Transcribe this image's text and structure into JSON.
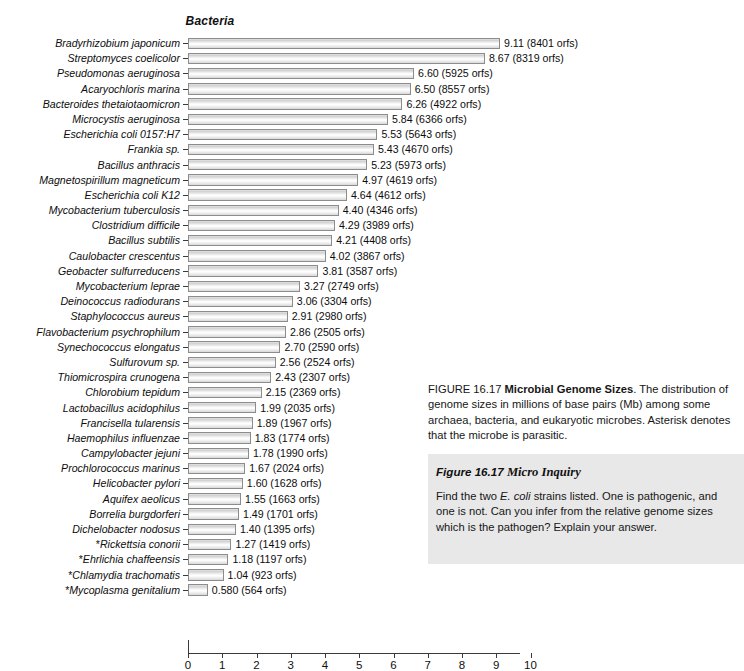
{
  "chart_data": {
    "type": "bar",
    "orientation": "horizontal",
    "title": "Bacteria",
    "xlabel": "",
    "ylabel": "",
    "xlim": [
      0,
      10
    ],
    "xticks": [
      0,
      1,
      2,
      3,
      4,
      5,
      6,
      7,
      8,
      9,
      10
    ],
    "grid": false,
    "legend": "none",
    "units": "millions of base pairs (Mb)",
    "categories": [
      "Bradyrhizobium japonicum",
      "Streptomyces coelicolor",
      "Pseudomonas aeruginosa",
      "Acaryochloris marina",
      "Bacteroides thetaiotaomicron",
      "Microcystis aeruginosa",
      "Escherichia coli 0157:H7",
      "Frankia sp.",
      "Bacillus anthracis",
      "Magnetospirillum magneticum",
      "Escherichia coli K12",
      "Mycobacterium tuberculosis",
      "Clostridium difficile",
      "Bacillus subtilis",
      "Caulobacter crescentus",
      "Geobacter sulfurreducens",
      "Mycobacterium leprae",
      "Deinococcus radiodurans",
      "Staphylococcus aureus",
      "Flavobacterium psychrophilum",
      "Synechococcus elongatus",
      "Sulfurovum sp.",
      "Thiomicrospira crunogena",
      "Chlorobium tepidum",
      "Lactobacillus acidophilus",
      "Francisella tularensis",
      "Haemophilus influenzae",
      "Campylobacter jejuni",
      "Prochlorococcus marinus",
      "Helicobacter pylori",
      "Aquifex aeolicus",
      "Borrelia burgdorferi",
      "Dichelobacter nodosus",
      "*Rickettsia conorii",
      "*Ehrlichia chaffeensis",
      "*Chlamydia trachomatis",
      "*Mycoplasma genitalium"
    ],
    "values": [
      9.11,
      8.67,
      6.6,
      6.5,
      6.26,
      5.84,
      5.53,
      5.43,
      5.23,
      4.97,
      4.64,
      4.4,
      4.29,
      4.21,
      4.02,
      3.81,
      3.27,
      3.06,
      2.91,
      2.86,
      2.7,
      2.56,
      2.43,
      2.15,
      1.99,
      1.89,
      1.83,
      1.78,
      1.67,
      1.6,
      1.55,
      1.49,
      1.4,
      1.27,
      1.18,
      1.04,
      0.58
    ],
    "orfs": [
      8401,
      8319,
      5925,
      8557,
      4922,
      6366,
      5643,
      4670,
      5973,
      4619,
      4612,
      4346,
      3989,
      4408,
      3867,
      3587,
      2749,
      3304,
      2980,
      2505,
      2590,
      2524,
      2307,
      2369,
      2035,
      1967,
      1774,
      1990,
      2024,
      1628,
      1663,
      1701,
      1395,
      1419,
      1197,
      923,
      564
    ],
    "data_labels": [
      "9.11 (8401 orfs)",
      "8.67 (8319 orfs)",
      "6.60 (5925 orfs)",
      "6.50 (8557 orfs)",
      "6.26 (4922 orfs)",
      "5.84 (6366 orfs)",
      "5.53 (5643 orfs)",
      "5.43 (4670 orfs)",
      "5.23 (5973 orfs)",
      "4.97 (4619 orfs)",
      "4.64 (4612 orfs)",
      "4.40 (4346 orfs)",
      "4.29 (3989 orfs)",
      "4.21 (4408 orfs)",
      "4.02 (3867 orfs)",
      "3.81 (3587 orfs)",
      "3.27 (2749 orfs)",
      "3.06 (3304 orfs)",
      "2.91 (2980 orfs)",
      "2.86 (2505 orfs)",
      "2.70 (2590 orfs)",
      "2.56 (2524 orfs)",
      "2.43 (2307 orfs)",
      "2.15 (2369 orfs)",
      "1.99 (2035 orfs)",
      "1.89 (1967 orfs)",
      "1.83 (1774 orfs)",
      "1.78 (1990 orfs)",
      "1.67 (2024 orfs)",
      "1.60 (1628 orfs)",
      "1.55 (1663 orfs)",
      "1.49 (1701 orfs)",
      "1.40 (1395 orfs)",
      "1.27 (1419 orfs)",
      "1.18 (1197 orfs)",
      "1.04 (923 orfs)",
      "0.580 (564 orfs)"
    ]
  },
  "caption": {
    "figure_number": "FIGURE 16.17",
    "figure_title": "Microbial Genome Sizes",
    "body": ". The distribution of genome sizes in millions of base pairs (Mb) among some archaea, bacteria, and eukaryotic microbes. Asterisk denotes that the microbe is parasitic."
  },
  "inquiry": {
    "heading_figure": "Figure 16.17",
    "heading_label": "Micro Inquiry",
    "text_part1": "Find the two ",
    "text_italic": "E. coli",
    "text_part2": " strains listed. One is pathogenic, and one is not. Can you infer from the relative genome sizes which is the pathogen? Explain your answer."
  },
  "colors": {
    "bar_fill": "#e8e8e8",
    "bar_border": "#8c8c8c",
    "axis": "#3a3a3a",
    "inquiry_bg": "#e8e8e8",
    "text": "#161616"
  }
}
